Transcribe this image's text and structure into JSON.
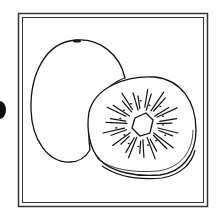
{
  "illustration": {
    "subject": "kiwi fruit",
    "description": "Black-and-white line drawing of a whole kiwi fruit and a halved kiwi slice showing seeds radiating from a star-shaped core, inside a double-line square frame",
    "colors": {
      "line": "#111111",
      "background": "#ffffff",
      "frame": "#333333"
    },
    "elements": [
      "frame",
      "whole-kiwi",
      "kiwi-slice",
      "edge-dot"
    ]
  }
}
